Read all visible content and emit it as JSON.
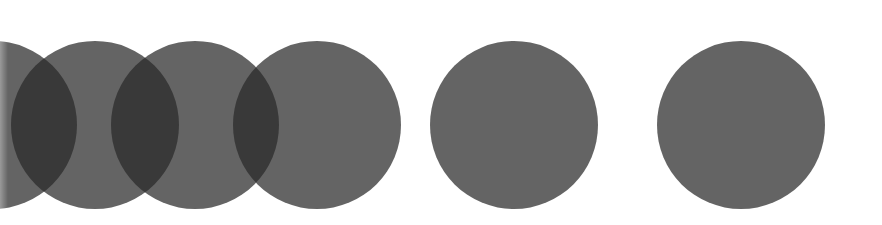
{
  "figure": {
    "background": "#ffffff",
    "circle_color": "rgba(40,40,40,0.72)",
    "circles": [
      {
        "name": "circle-1",
        "cx": -7,
        "cy": 125,
        "r": 84
      },
      {
        "name": "circle-2",
        "cx": 95,
        "cy": 125,
        "r": 84
      },
      {
        "name": "circle-3",
        "cx": 195,
        "cy": 125,
        "r": 84
      },
      {
        "name": "circle-4",
        "cx": 317,
        "cy": 125,
        "r": 84
      },
      {
        "name": "circle-5",
        "cx": 514,
        "cy": 125,
        "r": 84
      },
      {
        "name": "circle-6",
        "cx": 741,
        "cy": 125,
        "r": 84
      }
    ]
  }
}
